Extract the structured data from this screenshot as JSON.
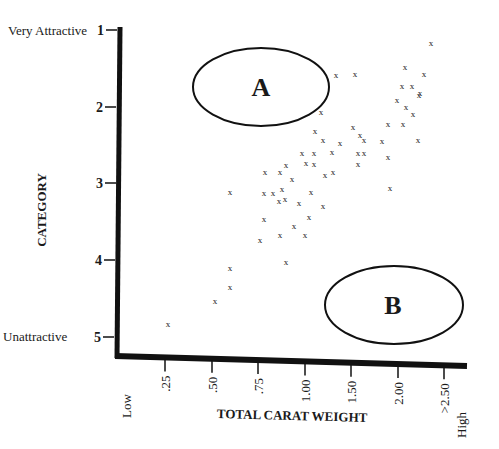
{
  "chart_data": {
    "type": "scatter",
    "title": "",
    "xlabel": "TOTAL CARAT WEIGHT",
    "ylabel": "CATEGORY",
    "x_tick_labels": [
      ".25",
      ".50",
      ".75",
      "1.00",
      "1.50",
      "2.00",
      ">2.50"
    ],
    "x_end_labels": {
      "low": "Low",
      "high": "High"
    },
    "y_tick_labels": [
      "1",
      "2",
      "3",
      "4",
      "5"
    ],
    "y_end_labels": {
      "top": "Very Attractive",
      "bottom": "Unattractive"
    },
    "ylim": [
      5,
      1
    ],
    "grid": false,
    "legend": null,
    "marker": "x",
    "annotations": [
      {
        "label": "A",
        "shape": "ellipse",
        "region": "high attractiveness, low carat weight",
        "center": {
          "x": 0.95,
          "y": 1.75
        }
      },
      {
        "label": "B",
        "shape": "ellipse",
        "region": "low attractiveness, high carat weight",
        "center": {
          "x": 2.0,
          "y": 4.6
        }
      }
    ],
    "points_px": [
      [
        431,
        43
      ],
      [
        405,
        67
      ],
      [
        424,
        74
      ],
      [
        402,
        86
      ],
      [
        412,
        86
      ],
      [
        420,
        93
      ],
      [
        397,
        100
      ],
      [
        419,
        95
      ],
      [
        406,
        107
      ],
      [
        413,
        114
      ],
      [
        388,
        124
      ],
      [
        403,
        124
      ],
      [
        382,
        141
      ],
      [
        418,
        140
      ],
      [
        364,
        140
      ],
      [
        364,
        153
      ],
      [
        388,
        157
      ],
      [
        390,
        188
      ],
      [
        336,
        75
      ],
      [
        355,
        74
      ],
      [
        321,
        112
      ],
      [
        353,
        127
      ],
      [
        360,
        135
      ],
      [
        358,
        153
      ],
      [
        358,
        164
      ],
      [
        315,
        131
      ],
      [
        323,
        140
      ],
      [
        340,
        143
      ],
      [
        332,
        152
      ],
      [
        302,
        153
      ],
      [
        314,
        153
      ],
      [
        306,
        163
      ],
      [
        314,
        164
      ],
      [
        325,
        175
      ],
      [
        333,
        172
      ],
      [
        286,
        165
      ],
      [
        265,
        172
      ],
      [
        280,
        172
      ],
      [
        292,
        179
      ],
      [
        273,
        193
      ],
      [
        282,
        189
      ],
      [
        264,
        193
      ],
      [
        285,
        199
      ],
      [
        299,
        203
      ],
      [
        311,
        192
      ],
      [
        279,
        201
      ],
      [
        323,
        206
      ],
      [
        264,
        219
      ],
      [
        309,
        217
      ],
      [
        294,
        226
      ],
      [
        280,
        235
      ],
      [
        305,
        235
      ],
      [
        260,
        240
      ],
      [
        286,
        262
      ],
      [
        230,
        192
      ],
      [
        230,
        268
      ],
      [
        230,
        287
      ],
      [
        215,
        301
      ],
      [
        168,
        324
      ]
    ],
    "points": [
      {
        "carat": ">2.50",
        "category": 1.2
      },
      {
        "carat": "2.00",
        "category": 1.5
      },
      {
        "carat": "2.00+",
        "category": 1.6
      },
      {
        "carat": "2.00",
        "category": 1.75
      },
      {
        "carat": "2.00",
        "category": 1.75
      },
      {
        "carat": "2.00+",
        "category": 1.85
      },
      {
        "carat": "1.90",
        "category": 1.9
      },
      {
        "carat": "2.00+",
        "category": 1.85
      },
      {
        "carat": "2.00",
        "category": 2.0
      },
      {
        "carat": "2.00",
        "category": 2.1
      },
      {
        "carat": "1.90",
        "category": 2.2
      },
      {
        "carat": "2.00",
        "category": 2.2
      },
      {
        "carat": "1.85",
        "category": 2.45
      },
      {
        "carat": "2.00+",
        "category": 2.4
      },
      {
        "carat": "1.65",
        "category": 2.4
      },
      {
        "carat": "1.65",
        "category": 2.6
      },
      {
        "carat": "1.90",
        "category": 2.65
      },
      {
        "carat": "1.90",
        "category": 3.05
      },
      {
        "carat": "1.35",
        "category": 1.6
      },
      {
        "carat": "1.50",
        "category": 1.6
      },
      {
        "carat": "1.15",
        "category": 2.07
      },
      {
        "carat": "1.50",
        "category": 2.25
      },
      {
        "carat": "1.55",
        "category": 2.35
      },
      {
        "carat": "1.55",
        "category": 2.6
      },
      {
        "carat": "1.55",
        "category": 2.75
      },
      {
        "carat": "1.10",
        "category": 2.3
      },
      {
        "carat": "1.20",
        "category": 2.45
      },
      {
        "carat": "1.35",
        "category": 2.45
      },
      {
        "carat": "1.30",
        "category": 2.6
      },
      {
        "carat": "0.98",
        "category": 2.6
      },
      {
        "carat": "1.10",
        "category": 2.6
      },
      {
        "carat": "1.00",
        "category": 2.75
      },
      {
        "carat": "1.10",
        "category": 2.75
      },
      {
        "carat": "1.20",
        "category": 2.9
      },
      {
        "carat": "1.30",
        "category": 2.85
      },
      {
        "carat": "0.88",
        "category": 2.75
      },
      {
        "carat": "0.78",
        "category": 2.85
      },
      {
        "carat": "0.85",
        "category": 2.85
      },
      {
        "carat": "0.92",
        "category": 2.95
      },
      {
        "carat": "0.82",
        "category": 3.13
      },
      {
        "carat": "0.87",
        "category": 3.08
      },
      {
        "carat": "0.78",
        "category": 3.13
      },
      {
        "carat": "0.88",
        "category": 3.2
      },
      {
        "carat": "0.95",
        "category": 3.25
      },
      {
        "carat": "1.05",
        "category": 3.1
      },
      {
        "carat": "0.86",
        "category": 3.23
      },
      {
        "carat": "1.20",
        "category": 3.3
      },
      {
        "carat": "0.78",
        "category": 3.47
      },
      {
        "carat": "1.05",
        "category": 3.44
      },
      {
        "carat": "0.93",
        "category": 3.55
      },
      {
        "carat": "0.86",
        "category": 3.67
      },
      {
        "carat": "1.00",
        "category": 3.67
      },
      {
        "carat": "0.75",
        "category": 3.74
      },
      {
        "carat": "0.88",
        "category": 4.02
      },
      {
        "carat": "0.60",
        "category": 3.1
      },
      {
        "carat": "0.60",
        "category": 4.1
      },
      {
        "carat": "0.60",
        "category": 4.35
      },
      {
        "carat": "0.52",
        "category": 4.53
      },
      {
        "carat": "0.27",
        "category": 4.83
      }
    ]
  },
  "labels": {
    "ylabel": "CATEGORY",
    "xlabel": "TOTAL CARAT WEIGHT",
    "y_top": "Very Attractive",
    "y_bottom": "Unattractive",
    "x_low": "Low",
    "x_high": "High",
    "ellipse_a": "A",
    "ellipse_b": "B"
  }
}
